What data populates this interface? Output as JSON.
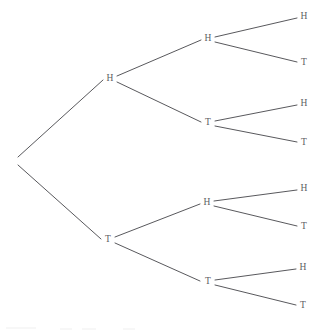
{
  "figure": {
    "name": "coin-flip-probability-tree",
    "background_color": "#ffffff",
    "line_color": "#3a3a3f",
    "label_color": "#5d5d62"
  },
  "chart_data": {
    "type": "diagram",
    "subtype": "binary-tree",
    "title": "",
    "xlabel": "",
    "ylabel": "",
    "depth": 3,
    "branching_factor": 2,
    "branch_labels": [
      "H",
      "T"
    ],
    "leaf_count": 8,
    "outcomes": [
      "HHH",
      "HHT",
      "HTH",
      "HTT",
      "THH",
      "THT",
      "TTH",
      "TTT"
    ],
    "nodes": [
      {
        "id": "root",
        "label": "",
        "level": 0,
        "x": 18,
        "y": 160,
        "show_label": false
      },
      {
        "id": "H",
        "label": "H",
        "level": 1,
        "x": 110,
        "y": 79,
        "show_label": true
      },
      {
        "id": "T",
        "label": "T",
        "level": 1,
        "x": 108,
        "y": 240,
        "show_label": true
      },
      {
        "id": "HH",
        "label": "H",
        "level": 2,
        "x": 208,
        "y": 39,
        "show_label": true
      },
      {
        "id": "HT",
        "label": "T",
        "level": 2,
        "x": 208,
        "y": 123,
        "show_label": true
      },
      {
        "id": "TH",
        "label": "H",
        "level": 2,
        "x": 207,
        "y": 203,
        "show_label": true
      },
      {
        "id": "TT",
        "label": "T",
        "level": 2,
        "x": 208,
        "y": 282,
        "show_label": true
      },
      {
        "id": "HHH",
        "label": "H",
        "level": 3,
        "x": 304,
        "y": 17,
        "show_label": true
      },
      {
        "id": "HHT",
        "label": "T",
        "level": 3,
        "x": 304,
        "y": 63,
        "show_label": true
      },
      {
        "id": "HTH",
        "label": "H",
        "level": 3,
        "x": 304,
        "y": 104,
        "show_label": true
      },
      {
        "id": "HTT",
        "label": "T",
        "level": 3,
        "x": 304,
        "y": 143,
        "show_label": true
      },
      {
        "id": "THH",
        "label": "H",
        "level": 3,
        "x": 304,
        "y": 189,
        "show_label": true
      },
      {
        "id": "THT",
        "label": "T",
        "level": 3,
        "x": 304,
        "y": 227,
        "show_label": true
      },
      {
        "id": "TTH",
        "label": "H",
        "level": 3,
        "x": 303,
        "y": 268,
        "show_label": true
      },
      {
        "id": "TTT",
        "label": "T",
        "level": 3,
        "x": 303,
        "y": 306,
        "show_label": true
      }
    ],
    "edges": [
      {
        "from": "root",
        "to": "H",
        "label": "H",
        "x1": 18,
        "y1": 157,
        "x2": 103,
        "y2": 80
      },
      {
        "from": "root",
        "to": "T",
        "label": "T",
        "x1": 18,
        "y1": 165,
        "x2": 101,
        "y2": 239
      },
      {
        "from": "H",
        "to": "HH",
        "label": "H",
        "x1": 117,
        "y1": 76,
        "x2": 201,
        "y2": 40
      },
      {
        "from": "H",
        "to": "HT",
        "label": "T",
        "x1": 117,
        "y1": 82,
        "x2": 201,
        "y2": 122
      },
      {
        "from": "T",
        "to": "TH",
        "label": "H",
        "x1": 115,
        "y1": 237,
        "x2": 200,
        "y2": 204
      },
      {
        "from": "T",
        "to": "TT",
        "label": "T",
        "x1": 115,
        "y1": 243,
        "x2": 200,
        "y2": 281
      },
      {
        "from": "HH",
        "to": "HHH",
        "label": "H",
        "x1": 215,
        "y1": 37,
        "x2": 297,
        "y2": 18
      },
      {
        "from": "HH",
        "to": "HHT",
        "label": "T",
        "x1": 215,
        "y1": 42,
        "x2": 297,
        "y2": 62
      },
      {
        "from": "HT",
        "to": "HTH",
        "label": "H",
        "x1": 215,
        "y1": 121,
        "x2": 297,
        "y2": 105
      },
      {
        "from": "HT",
        "to": "HTT",
        "label": "T",
        "x1": 215,
        "y1": 126,
        "x2": 297,
        "y2": 142
      },
      {
        "from": "TH",
        "to": "THH",
        "label": "H",
        "x1": 214,
        "y1": 201,
        "x2": 297,
        "y2": 190
      },
      {
        "from": "TH",
        "to": "THT",
        "label": "T",
        "x1": 214,
        "y1": 206,
        "x2": 297,
        "y2": 226
      },
      {
        "from": "TT",
        "to": "TTH",
        "label": "H",
        "x1": 215,
        "y1": 280,
        "x2": 296,
        "y2": 269
      },
      {
        "from": "TT",
        "to": "TTT",
        "label": "T",
        "x1": 215,
        "y1": 285,
        "x2": 296,
        "y2": 305
      }
    ]
  }
}
